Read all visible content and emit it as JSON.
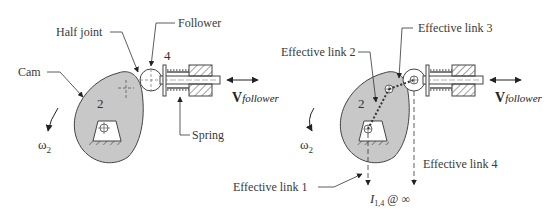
{
  "left_figure": {
    "labels": {
      "half_joint": "Half joint",
      "follower": "Follower",
      "cam": "Cam",
      "spring": "Spring",
      "link_cam": "2",
      "link_follower": "4",
      "omega_symbol": "ω",
      "omega_sub": "2",
      "velocity_symbol": "V",
      "velocity_sub": "follower"
    }
  },
  "right_figure": {
    "labels": {
      "effective_link_1": "Effective link 1",
      "effective_link_2": "Effective link 2",
      "effective_link_3": "Effective link 3",
      "effective_link_4": "Effective link 4",
      "link_cam": "2",
      "omega_symbol": "ω",
      "omega_sub": "2",
      "velocity_symbol": "V",
      "velocity_sub": "follower",
      "instant_center_symbol": "I",
      "instant_center_sub": "1,4",
      "instant_center_suffix": "@ ∞"
    }
  },
  "colors": {
    "cam_fill": "#c8c8c8",
    "stroke": "#333333",
    "background": "#ffffff"
  }
}
